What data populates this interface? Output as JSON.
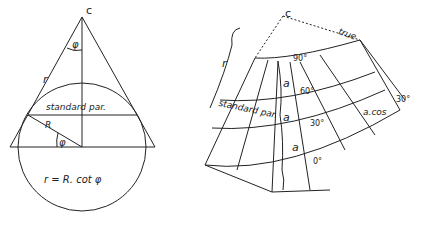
{
  "left_figure": {
    "apex_label": "c",
    "angle_label": "φ",
    "slant_label": "r",
    "standard_parallel_label": "standard par.",
    "radius_label": "R",
    "lower_angle_label": "φ",
    "formula": "r = R. cot φ"
  },
  "right_figure": {
    "apex_label": "c",
    "side_label": "r",
    "true_label": "true",
    "latitude_labels": [
      "90°",
      "60°",
      "30°",
      "0°"
    ],
    "spacing_labels": [
      "a",
      "a",
      "a"
    ],
    "standard_parallel_label": "standard par.",
    "cos_label": "a.cos",
    "cos_angle_label": "30°"
  },
  "colors": {
    "ink": "#222222",
    "background": "#ffffff"
  }
}
